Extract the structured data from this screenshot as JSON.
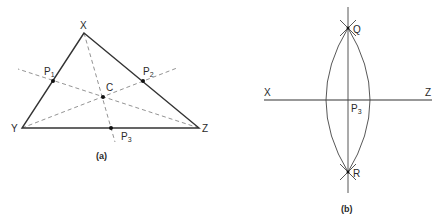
{
  "figure_a": {
    "caption": "(a)",
    "vertices": {
      "X": {
        "label": "X",
        "x": 84,
        "y": 33
      },
      "Y": {
        "label": "Y",
        "x": 22,
        "y": 128
      },
      "Z": {
        "label": "Z",
        "x": 199,
        "y": 128
      }
    },
    "midpoints": {
      "P1": {
        "label": "P",
        "sub": "1",
        "x": 53,
        "y": 81
      },
      "P2": {
        "label": "P",
        "sub": "2",
        "x": 143,
        "y": 81
      },
      "P3": {
        "label": "P",
        "sub": "3",
        "x": 111,
        "y": 128
      }
    },
    "centroid": {
      "label": "C",
      "x": 103,
      "y": 97
    },
    "description": "Triangle XYZ with medians (dashed) through midpoints P1, P2, P3 meeting at centroid C"
  },
  "figure_b": {
    "caption": "(b)",
    "labels": {
      "X": "X",
      "Z": "Z",
      "Q": "Q",
      "R": "R",
      "P3": {
        "label": "P",
        "sub": "3"
      }
    },
    "description": "Perpendicular bisector construction of segment XZ: arcs intersect at Q and R, line QR crosses XZ at midpoint P3"
  }
}
